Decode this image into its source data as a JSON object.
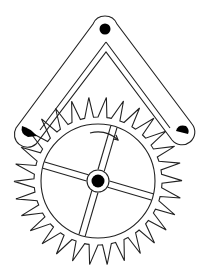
{
  "diagram": {
    "subject": "Anchor escapement mechanism",
    "components": [
      {
        "name": "anchor",
        "description": "Inverted-V anchor (pallet fork) with pivot at top"
      },
      {
        "name": "pivot",
        "description": "Black pivot dot at anchor apex"
      },
      {
        "name": "entry-pallet",
        "description": "Left black pallet engaging wheel teeth"
      },
      {
        "name": "exit-pallet",
        "description": "Right black pallet engaging wheel teeth"
      },
      {
        "name": "escape-wheel",
        "description": "Toothed wheel with 4 spokes"
      },
      {
        "name": "hub",
        "description": "Central black axle"
      },
      {
        "name": "rotation-arrow",
        "description": "Arrow indicating clockwise rotation"
      }
    ],
    "rotation_direction": "clockwise",
    "tooth_count": 30,
    "spoke_count": 4
  },
  "colors": {
    "line": "#222222",
    "fill": "#000000",
    "background": "#ffffff"
  }
}
